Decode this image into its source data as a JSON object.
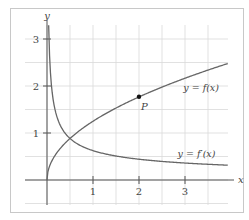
{
  "chart_data": {
    "type": "line",
    "title": "",
    "xlabel": "x",
    "ylabel": "y",
    "xlim": [
      -0.47,
      3.93
    ],
    "ylim": [
      -0.53,
      3.3
    ],
    "grid": true,
    "grid_step": 0.5,
    "x_ticks": [
      "1",
      "2",
      "3"
    ],
    "y_ticks": [
      "1",
      "2",
      "3"
    ],
    "series": [
      {
        "name": "y = f(x)",
        "formula": "1.25*sqrt(x)",
        "x": [
          0,
          0.25,
          0.5,
          1,
          1.5,
          2,
          2.5,
          3,
          3.5,
          3.93
        ],
        "values": [
          0,
          0.63,
          0.88,
          1.25,
          1.53,
          1.77,
          1.98,
          2.17,
          2.34,
          2.48
        ]
      },
      {
        "name": "y = f′(x)",
        "formula": "0.625/sqrt(x)",
        "x": [
          0.04,
          0.1,
          0.25,
          0.5,
          1,
          1.5,
          2,
          2.5,
          3,
          3.5,
          3.93
        ],
        "values": [
          3.13,
          1.98,
          1.25,
          0.88,
          0.63,
          0.51,
          0.44,
          0.4,
          0.36,
          0.33,
          0.32
        ]
      }
    ],
    "annotations": [
      {
        "label": "P",
        "x": 2,
        "y": 1.77,
        "marker": "dot"
      },
      {
        "label": "y = f(x)",
        "x": 3.35,
        "y": 1.95
      },
      {
        "label": "y = f′(x)",
        "x": 3.25,
        "y": 0.55
      }
    ]
  }
}
